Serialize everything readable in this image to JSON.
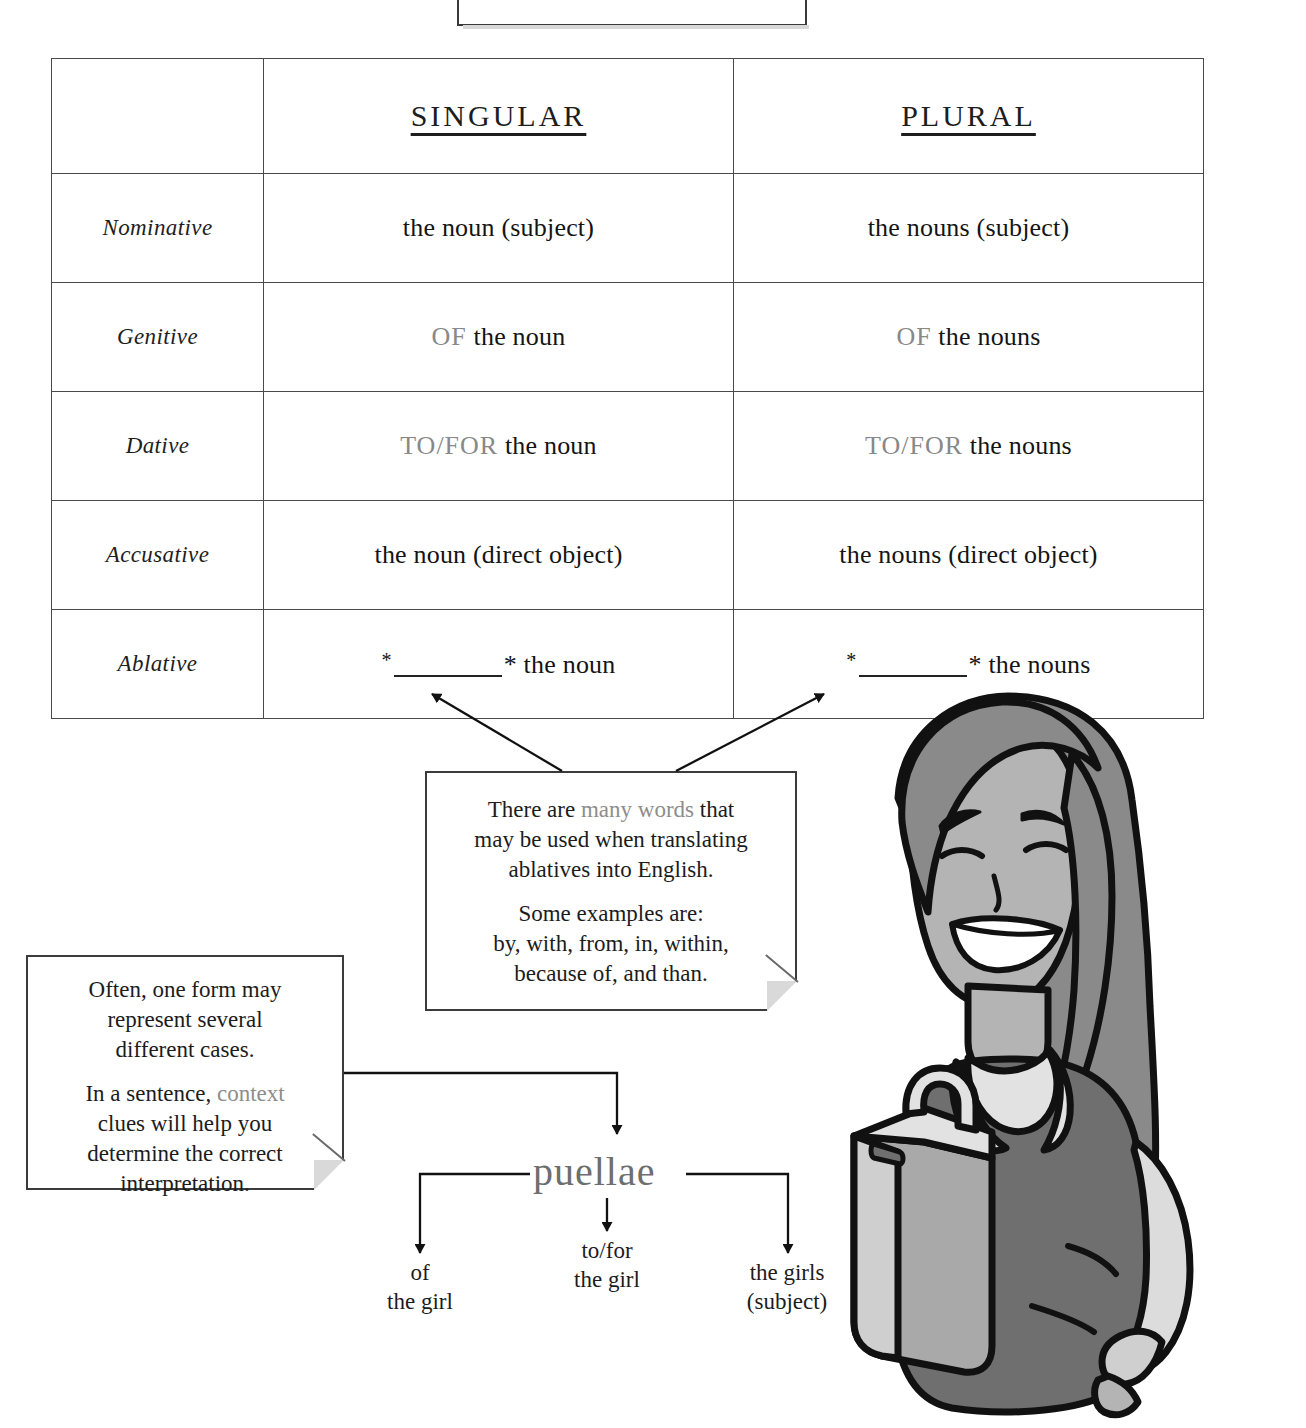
{
  "top_note": {
    "text": "of each noun case."
  },
  "table": {
    "columns": {
      "case_header": "",
      "singular": "SINGULAR",
      "plural": "PLURAL"
    },
    "rows": [
      {
        "case": "Nominative",
        "singular": "the noun (subject)",
        "plural": "the nouns (subject)"
      },
      {
        "case": "Genitive",
        "singular_keyword": "OF",
        "singular_rest": " the noun",
        "plural_keyword": "OF",
        "plural_rest": " the nouns"
      },
      {
        "case": "Dative",
        "singular_keyword": "TO/FOR",
        "singular_rest": " the noun",
        "plural_keyword": "TO/FOR",
        "plural_rest": " the nouns"
      },
      {
        "case": "Accusative",
        "singular": "the noun (direct object)",
        "plural": "the nouns (direct object)"
      },
      {
        "case": "Ablative",
        "singular_prefix": "*",
        "singular_suffix": "* the noun",
        "plural_prefix": "*",
        "plural_suffix": "* the nouns"
      }
    ]
  },
  "ablative_callout": {
    "line1_a": "There are ",
    "line1_gray": "many words",
    "line1_b": " that",
    "line2": "may be used when translating",
    "line3": "ablatives into English.",
    "line4": "Some examples are:",
    "line5": "by, with, from, in, within,",
    "line6": "because of, and than."
  },
  "context_callout": {
    "line1": "Often, one form may",
    "line2": "represent several",
    "line3": "different cases.",
    "line4_a": "In a sentence, ",
    "line4_gray": "context",
    "line5": "clues will help you",
    "line6": "determine the correct",
    "line7": "interpretation."
  },
  "diagram": {
    "headword": "puellae",
    "branches": [
      {
        "line1": "of",
        "line2": "the girl"
      },
      {
        "line1": "to/for",
        "line2": "the girl"
      },
      {
        "line1": "the girls",
        "line2": "(subject)"
      }
    ]
  },
  "illustration": {
    "name": "smiling-woman-with-briefcase",
    "colors": {
      "outline": "#111111",
      "hair": "#8a8a8a",
      "skin": "#b4b4b4",
      "dress": "#6f6f6f",
      "collar": "#e2e2e2",
      "sleeve": "#dcdcdc",
      "briefcase": "#a9a9a9",
      "briefcase_light": "#cfcfcf"
    }
  },
  "colors": {
    "ink": "#1a1a1a",
    "gray_keyword": "#888888",
    "rule": "#4a4a4a",
    "headword": "#6e6e6e"
  }
}
